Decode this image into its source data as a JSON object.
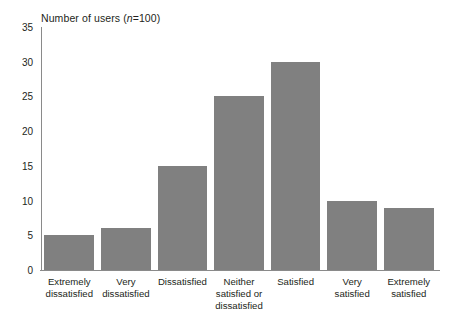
{
  "chart_data": {
    "type": "bar",
    "title": "Number of users (n=100)",
    "title_parts": {
      "prefix": "Number of users (",
      "italic": "n",
      "suffix": "=100)"
    },
    "xlabel": "",
    "ylabel": "",
    "categories": [
      "Extremely dissatisfied",
      "Very dissatisfied",
      "Dissatisfied",
      "Neither satisfied or dissatisfied",
      "Satisfied",
      "Very satisfied",
      "Extremely satisfied"
    ],
    "category_lines": [
      [
        "Extremely",
        "dissatisfied"
      ],
      [
        "Very",
        "dissatisfied"
      ],
      [
        "Dissatisfied"
      ],
      [
        "Neither",
        "satisfied or",
        "dissatisfied"
      ],
      [
        "Satisfied"
      ],
      [
        "Very",
        "satisfied"
      ],
      [
        "Extremely",
        "satisfied"
      ]
    ],
    "values": [
      5,
      6,
      15,
      25,
      30,
      10,
      9
    ],
    "ylim": [
      0,
      35
    ],
    "yticks": [
      0,
      5,
      10,
      15,
      20,
      25,
      30,
      35
    ],
    "ytick_labels": [
      "0",
      "5",
      "10",
      "15",
      "20",
      "25",
      "30",
      "35"
    ],
    "grid": false,
    "legend": null,
    "bar_color": "#808080",
    "axis_color": "#8a8a8a",
    "text_color": "#231f20"
  }
}
